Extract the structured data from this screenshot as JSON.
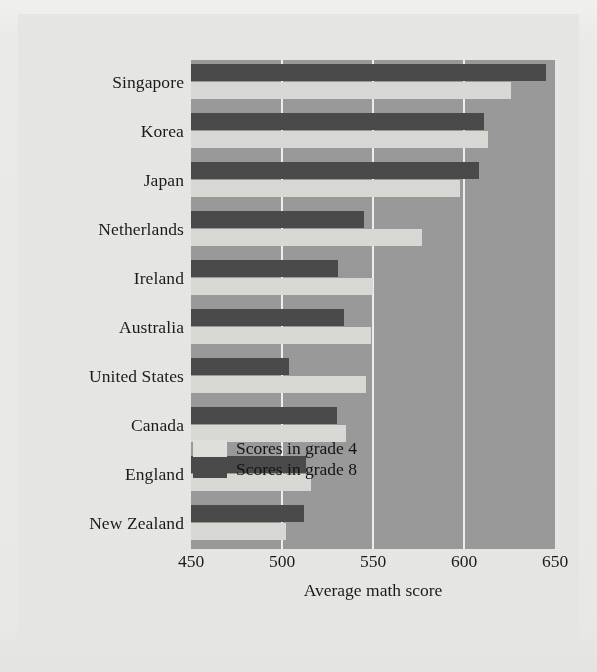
{
  "chart_data": {
    "type": "bar",
    "orientation": "horizontal",
    "title": "",
    "xlabel": "Average math score",
    "ylabel": "",
    "xlim": [
      450,
      650
    ],
    "xticks": [
      450,
      500,
      550,
      600,
      650
    ],
    "xtick_labels": [
      "450",
      "500",
      "550",
      "600",
      "650"
    ],
    "grid": true,
    "grid_axis": "x",
    "legend_position": "inside-lower-right",
    "categories": [
      "Singapore",
      "Korea",
      "Japan",
      "Netherlands",
      "Ireland",
      "Australia",
      "United States",
      "Canada",
      "England",
      "New Zealand"
    ],
    "series": [
      {
        "name": "Scores in grade 4",
        "color": "#d9d9d6",
        "values": [
          626,
          613,
          598,
          577,
          550,
          549,
          546,
          535,
          516,
          502
        ]
      },
      {
        "name": "Scores in grade 8",
        "color": "#4a4a4a",
        "values": [
          645,
          611,
          608,
          545,
          531,
          534,
          504,
          530,
          513,
          512
        ]
      }
    ]
  },
  "legend": {
    "items": [
      {
        "label": "Scores in grade 4",
        "key": "grade4"
      },
      {
        "label": "Scores in grade 8",
        "key": "grade8"
      }
    ]
  },
  "axis": {
    "x_title": "Average math score",
    "ticks": [
      "450",
      "500",
      "550",
      "600",
      "650"
    ]
  },
  "colors": {
    "grade4": "#d9d9d6",
    "grade8": "#4a4a4a",
    "plot_background": "#9a9a9a",
    "gridline": "#efefed",
    "page_background": "#e9e9e7",
    "text": "#1b1b1b"
  }
}
